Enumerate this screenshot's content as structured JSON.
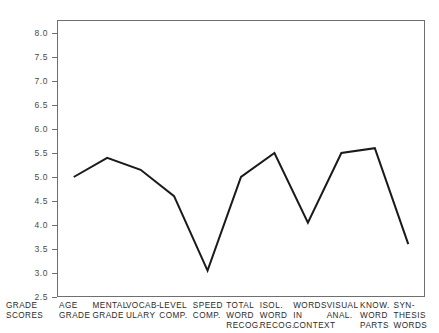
{
  "chart_data": {
    "type": "line",
    "title": "",
    "subtitle": "",
    "xlabel": "",
    "ylabel": "GRADE\nSCORES",
    "ylim": [
      2.5,
      8.0
    ],
    "yticks": [
      "8.0",
      "7.5",
      "7.0",
      "6.5",
      "6.0",
      "5.5",
      "5.0",
      "4.5",
      "4.0",
      "3.5",
      "3.0",
      "2.5"
    ],
    "ytick_values": [
      8.0,
      7.5,
      7.0,
      6.5,
      6.0,
      5.5,
      5.0,
      4.5,
      4.0,
      3.5,
      3.0,
      2.5
    ],
    "grid": false,
    "legend": "none",
    "categories": [
      "AGE\nGRADE",
      "MENTAL\nGRADE",
      "VOCAB-\nULARY",
      "LEVEL\nCOMP.",
      "SPEED\nCOMP.",
      "TOTAL\nWORD\nRECOG.",
      "ISOL.\nWORD\nRECOG.",
      "WORDS\nIN\nCONTEXT",
      "VISUAL\nANAL.",
      "KNOW.\nWORD\nPARTS",
      "SYN-\nTHESIS\nWORDS"
    ],
    "values": [
      5.0,
      5.4,
      5.15,
      4.6,
      3.05,
      5.0,
      5.5,
      4.05,
      5.5,
      5.6,
      3.6
    ],
    "series": [
      {
        "name": "Grade Scores Profile",
        "values": [
          5.0,
          5.4,
          5.15,
          4.6,
          3.05,
          5.0,
          5.5,
          4.05,
          5.5,
          5.6,
          3.6
        ]
      }
    ],
    "line_color": "#1a1a1a",
    "frame_color": "#6f6f6f"
  },
  "axis": {
    "y_title": "GRADE\nSCORES"
  }
}
